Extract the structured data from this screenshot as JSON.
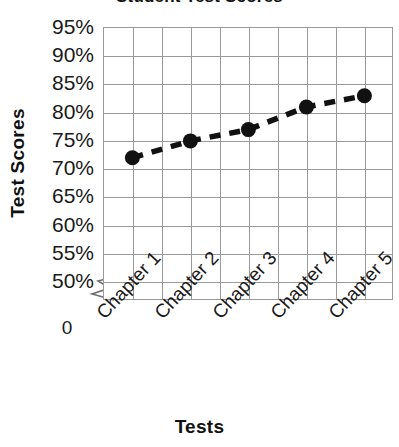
{
  "chart_data": {
    "type": "line",
    "title": "Student Test Scores",
    "xlabel": "Tests",
    "ylabel": "Test Scores",
    "categories": [
      "Chapter 1",
      "Chapter 2",
      "Chapter 3",
      "Chapter 4",
      "Chapter 5"
    ],
    "values": [
      72,
      75,
      77,
      81,
      83
    ],
    "series": [
      {
        "name": "Test Scores",
        "values": [
          72,
          75,
          77,
          81,
          83
        ]
      }
    ],
    "ylim": [
      50,
      95
    ],
    "ytick_labels": [
      "95%",
      "90%",
      "85%",
      "80%",
      "75%",
      "70%",
      "65%",
      "60%",
      "55%",
      "50%"
    ],
    "ytick_values": [
      95,
      90,
      85,
      80,
      75,
      70,
      65,
      60,
      55,
      50
    ],
    "axis_break_label": "0",
    "axis_break": true,
    "grid": true,
    "grid_color": "#9a9a9a",
    "legend": false,
    "line_style": "dashed",
    "line_color": "#111111",
    "marker": "circle",
    "marker_color": "#111111",
    "plot_background": "#ffffff",
    "vertical_grid_columns": 10,
    "xtick_rotation": -47
  }
}
